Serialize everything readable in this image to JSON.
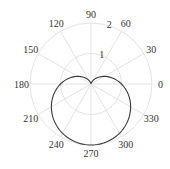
{
  "chart_data": {
    "type": "line",
    "subtype": "polar",
    "title": "",
    "equation": "r = 1 - sin(theta)",
    "shape": "cardioid",
    "theta_ticks_deg": [
      0,
      30,
      60,
      90,
      120,
      150,
      180,
      210,
      240,
      270,
      300,
      330
    ],
    "theta_tick_labels": [
      "0",
      "30",
      "60",
      "90",
      "120",
      "150",
      "180",
      "210",
      "240",
      "270",
      "300",
      "330"
    ],
    "r_ticks": [
      1,
      2
    ],
    "r_tick_labels": [
      "1",
      "2"
    ],
    "rlim": [
      0,
      2
    ],
    "grid": true,
    "legend": null,
    "series": [
      {
        "name": "cardioid",
        "theta_deg": [
          0,
          30,
          60,
          90,
          120,
          150,
          180,
          210,
          240,
          270,
          300,
          330,
          360
        ],
        "r": [
          1.0,
          0.5,
          0.134,
          0.0,
          0.134,
          0.5,
          1.0,
          1.5,
          1.866,
          2.0,
          1.866,
          1.5,
          1.0
        ]
      }
    ]
  },
  "style": {
    "grid_color": "#e3e3e3",
    "line_color": "#3a3a3a",
    "text_color": "#333333"
  }
}
